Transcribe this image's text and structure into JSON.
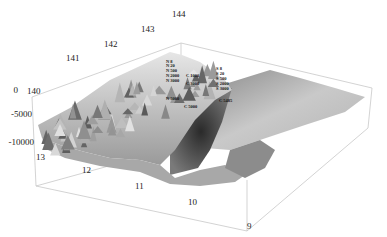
{
  "chart_data": {
    "type": "surface3d",
    "title": "",
    "x_axis": {
      "label": "",
      "ticks": [
        "140",
        "141",
        "142",
        "143",
        "144"
      ],
      "range": [
        140,
        144
      ]
    },
    "y_axis": {
      "label": "",
      "ticks": [
        "13",
        "12",
        "11",
        "10",
        "9"
      ],
      "range": [
        9,
        13
      ]
    },
    "z_axis": {
      "label": "",
      "ticks": [
        "0",
        "-5000",
        "-10000"
      ],
      "range": [
        -10000,
        0
      ]
    },
    "grid": false,
    "legend": null,
    "colormap": "grayscale",
    "annotations": [
      {
        "text": "N 8"
      },
      {
        "text": "N 20"
      },
      {
        "text": "N 500"
      },
      {
        "text": "N 2000"
      },
      {
        "text": "N 3000"
      },
      {
        "text": "N 5000"
      },
      {
        "text": "C 1000"
      },
      {
        "text": "C 3000"
      },
      {
        "text": "C 5000"
      },
      {
        "text": "S 8"
      },
      {
        "text": "S 20"
      },
      {
        "text": "S 500"
      },
      {
        "text": "S 2000"
      },
      {
        "text": "S 3000"
      },
      {
        "text": "C 5485"
      }
    ],
    "features": {
      "ridge": "mountainous ridge with many spikes along the 141-144 side, peaks near 0",
      "trench": "deep trench near -10000 running between ridge and flat plateau",
      "plateau": "smooth sloping plain toward the 9 / 144 corner"
    }
  }
}
